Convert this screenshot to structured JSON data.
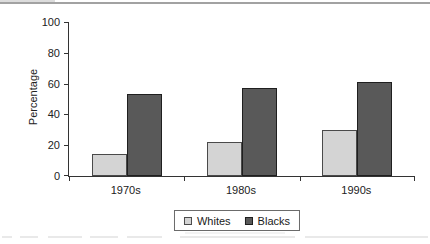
{
  "chart_data": {
    "type": "bar",
    "title": "",
    "categories": [
      "1970s",
      "1980s",
      "1990s"
    ],
    "series": [
      {
        "name": "Whites",
        "values": [
          14,
          22,
          30
        ],
        "fill": "#d4d4d4",
        "border": "#4a4a4a"
      },
      {
        "name": "Blacks",
        "values": [
          53,
          57,
          61
        ],
        "fill": "#595959",
        "border": "#1f1f1f"
      }
    ],
    "ylabel": "Percentage",
    "ylim": [
      0,
      100
    ],
    "yticks": [
      0,
      20,
      40,
      60,
      80,
      100
    ],
    "ytick_labels": {
      "t0": "0",
      "t20": "20",
      "t40": "40",
      "t60": "60",
      "t80": "80",
      "t100": "100"
    },
    "xlabel": "",
    "grid": false,
    "legend_position": "bottom",
    "colors": {
      "axis": "#333333",
      "top_rule": "#a2a2a2"
    }
  }
}
